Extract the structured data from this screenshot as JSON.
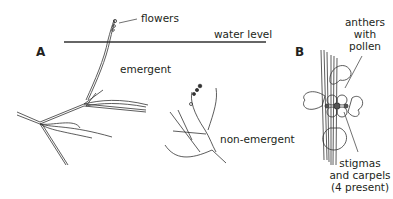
{
  "figure": {
    "panels": [
      {
        "id": "A",
        "label": "A"
      },
      {
        "id": "B",
        "label": "B"
      }
    ],
    "panel_a": {
      "labels": {
        "flowers": "flowers",
        "water_level": "water level",
        "emergent": "emergent",
        "non_emergent": "non-emergent"
      }
    },
    "panel_b": {
      "labels": {
        "anthers_line1": "anthers",
        "anthers_line2": "with",
        "anthers_line3": "pollen",
        "stigmas_line1": "stigmas",
        "stigmas_line2": "and carpels",
        "stigmas_line3": "(4 present)"
      }
    },
    "colors": {
      "ink": "#231f20",
      "background": "#ffffff"
    }
  }
}
